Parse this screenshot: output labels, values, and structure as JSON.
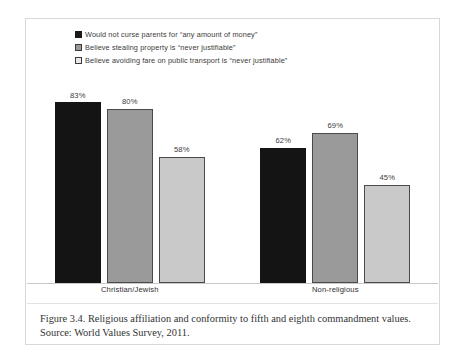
{
  "figure": {
    "caption": "Figure 3.4. Religious affiliation and conformity to fifth and eighth commandment values. Source: World Values Survey, 2011."
  },
  "chart_data": {
    "type": "bar",
    "title": "",
    "xlabel": "",
    "ylabel": "",
    "ylim": [
      0,
      100
    ],
    "grid": false,
    "legend_position": "top",
    "categories": [
      "Christian/Jewish",
      "Non-religious"
    ],
    "series": [
      {
        "name": "Would not curse parents for “any amount of money”",
        "color": "#141414",
        "values": [
          83,
          80
        ],
        "labels": [
          "83%",
          "80%"
        ]
      },
      {
        "name": "Believe stealing property is “never justifiable”",
        "color": "#9a9a9a",
        "values": [
          80,
          69
        ],
        "labels": [
          "80%",
          "69%"
        ]
      },
      {
        "name": "Believe avoiding fare on public transport is “never justifiable”",
        "color": "#c9c9c9",
        "values": [
          58,
          45
        ],
        "labels": [
          "58%",
          "45%"
        ]
      }
    ],
    "groups": [
      {
        "category": "Christian/Jewish",
        "bars": [
          {
            "series": "Would not curse parents for “any amount of money”",
            "value": 83,
            "label": "83%"
          },
          {
            "series": "Believe stealing property is “never justifiable”",
            "value": 80,
            "label": "80%"
          },
          {
            "series": "Believe avoiding fare on public transport is “never justifiable”",
            "value": 58,
            "label": "58%"
          }
        ]
      },
      {
        "category": "Non-religious",
        "bars": [
          {
            "series": "Would not curse parents for “any amount of money”",
            "value": 62,
            "label": "62%"
          },
          {
            "series": "Believe stealing property is “never justifiable”",
            "value": 69,
            "label": "69%"
          },
          {
            "series": "Believe avoiding fare on public transport is “never justifiable”",
            "value": 45,
            "label": "45%"
          }
        ]
      }
    ]
  }
}
